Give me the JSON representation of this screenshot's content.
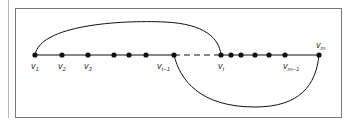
{
  "diagram": {
    "type": "path-graph-with-arcs",
    "baseline_y": 55,
    "vertices": [
      {
        "id": "v1",
        "x": 35,
        "label": "v",
        "sub": "1"
      },
      {
        "id": "v2",
        "x": 62,
        "label": "v",
        "sub": "2"
      },
      {
        "id": "v3",
        "x": 88,
        "label": "v",
        "sub": "3"
      },
      {
        "id": "a1",
        "x": 114,
        "label": "",
        "sub": ""
      },
      {
        "id": "a2",
        "x": 129,
        "label": "",
        "sub": ""
      },
      {
        "id": "a3",
        "x": 146,
        "label": "",
        "sub": ""
      },
      {
        "id": "vt-1",
        "x": 174,
        "label": "v",
        "sub": "t−1"
      },
      {
        "id": "vt",
        "x": 221,
        "label": "v",
        "sub": "t"
      },
      {
        "id": "b1",
        "x": 231,
        "label": "",
        "sub": ""
      },
      {
        "id": "b2",
        "x": 241,
        "label": "",
        "sub": ""
      },
      {
        "id": "b3",
        "x": 255,
        "label": "",
        "sub": ""
      },
      {
        "id": "b4",
        "x": 269,
        "label": "",
        "sub": ""
      },
      {
        "id": "vm-1",
        "x": 285,
        "label": "v",
        "sub": "m−1"
      },
      {
        "id": "vm",
        "x": 319,
        "label": "v",
        "sub": "m"
      }
    ],
    "edges": [
      {
        "from": "v1",
        "to": "vt-1",
        "style": "solid"
      },
      {
        "from": "vt-1",
        "to": "vt",
        "style": "dashed"
      },
      {
        "from": "vt",
        "to": "vm",
        "style": "solid"
      }
    ],
    "arcs": [
      {
        "from": "v1",
        "to": "vt",
        "side": "above"
      },
      {
        "from": "vt-1",
        "to": "vm",
        "side": "below"
      }
    ],
    "labels": {
      "v1": "v",
      "v1_sub": "1",
      "v2": "v",
      "v2_sub": "2",
      "v3": "v",
      "v3_sub": "3",
      "vt1": "v",
      "vt1_sub": "t−1",
      "vt": "v",
      "vt_sub": "t",
      "vm1": "v",
      "vm1_sub": "m−1",
      "vm": "v",
      "vm_sub": "m"
    },
    "colors": {
      "ink": "#111111",
      "frame": "#777777",
      "rule": "#b8b8b8"
    }
  }
}
